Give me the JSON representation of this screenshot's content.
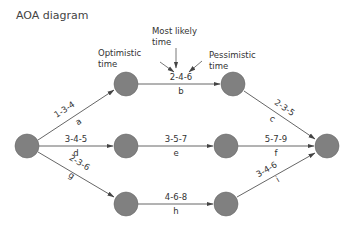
{
  "title": "AOA diagram",
  "annotations": {
    "optimistic": [
      "Optimistic",
      "time"
    ],
    "most_likely": [
      "Most likely",
      "time"
    ],
    "pessimistic": [
      "Pessimistic",
      "time"
    ]
  },
  "nodes": [
    {
      "id": "start",
      "x": 27,
      "y": 146
    },
    {
      "id": "n1",
      "x": 126,
      "y": 84
    },
    {
      "id": "n2",
      "x": 233,
      "y": 84
    },
    {
      "id": "n3",
      "x": 126,
      "y": 146
    },
    {
      "id": "n4",
      "x": 226,
      "y": 146
    },
    {
      "id": "n5",
      "x": 126,
      "y": 204
    },
    {
      "id": "n6",
      "x": 226,
      "y": 204
    },
    {
      "id": "end",
      "x": 327,
      "y": 146
    }
  ],
  "activities": [
    {
      "name": "a",
      "times": "1-3-4",
      "from": "start",
      "to": "n1"
    },
    {
      "name": "b",
      "times": "2-4-6",
      "from": "n1",
      "to": "n2"
    },
    {
      "name": "c",
      "times": "2-3-5",
      "from": "n2",
      "to": "end"
    },
    {
      "name": "d",
      "times": "3-4-5",
      "from": "start",
      "to": "n3"
    },
    {
      "name": "e",
      "times": "3-5-7",
      "from": "n3",
      "to": "n4"
    },
    {
      "name": "f",
      "times": "5-7-9",
      "from": "n4",
      "to": "end"
    },
    {
      "name": "g",
      "times": "2-3-6",
      "from": "start",
      "to": "n5"
    },
    {
      "name": "h",
      "times": "4-6-8",
      "from": "n5",
      "to": "n6"
    },
    {
      "name": "i",
      "times": "3-4-6",
      "from": "n6",
      "to": "end"
    }
  ]
}
